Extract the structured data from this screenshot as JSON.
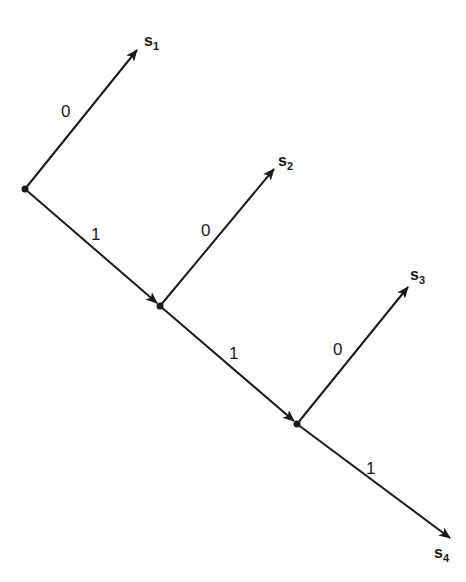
{
  "diagram": {
    "type": "binary code tree (comma code)",
    "nodes": [
      {
        "id": "n0",
        "x": 25,
        "y": 189
      },
      {
        "id": "n1",
        "x": 160,
        "y": 306
      },
      {
        "id": "n2",
        "x": 297,
        "y": 424
      }
    ],
    "leaves": [
      {
        "id": "s1",
        "symbol": "s",
        "subscript": "1",
        "x": 137,
        "y": 50
      },
      {
        "id": "s2",
        "symbol": "s",
        "subscript": "2",
        "x": 274,
        "y": 169
      },
      {
        "id": "s3",
        "symbol": "s",
        "subscript": "3",
        "x": 408,
        "y": 287
      },
      {
        "id": "s4",
        "symbol": "s",
        "subscript": "4",
        "x": 450,
        "y": 538
      }
    ],
    "edges": [
      {
        "from": "n0",
        "to": "s1",
        "label": "0"
      },
      {
        "from": "n0",
        "to": "n1",
        "label": "1"
      },
      {
        "from": "n1",
        "to": "s2",
        "label": "0"
      },
      {
        "from": "n1",
        "to": "n2",
        "label": "1"
      },
      {
        "from": "n2",
        "to": "s3",
        "label": "0"
      },
      {
        "from": "n2",
        "to": "s4",
        "label": "1"
      }
    ]
  }
}
